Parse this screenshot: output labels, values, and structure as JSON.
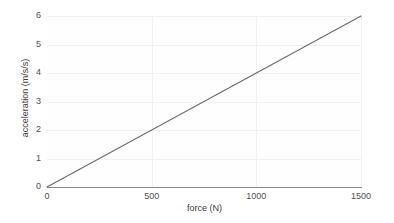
{
  "chart_data": {
    "type": "line",
    "title": "",
    "xlabel": "force (N)",
    "ylabel": "acceleration (m/s/s)",
    "xlim": [
      0,
      1500
    ],
    "ylim": [
      0,
      6
    ],
    "xticks": [
      0,
      500,
      1000,
      1500
    ],
    "xtick_labels": [
      "0",
      "500",
      "1000",
      "1500"
    ],
    "yticks": [
      0,
      1,
      2,
      3,
      4,
      5,
      6
    ],
    "ytick_labels": [
      "0",
      "1",
      "2",
      "3",
      "4",
      "5",
      "6"
    ],
    "grid": true,
    "legend": null,
    "series": [
      {
        "name": "acceleration",
        "color": "#6b6b6b",
        "x": [
          0,
          250,
          500,
          750,
          1000,
          1250,
          1500
        ],
        "values": [
          0,
          1,
          2,
          3,
          4,
          5,
          6
        ]
      }
    ],
    "annotations": []
  },
  "style": {
    "background": "#ffffff",
    "plot_background": "#fefeff",
    "gridline_color": "#f1f1f5",
    "axis_color": "#8a8a8a",
    "tick_text_color": "#4d4d4d",
    "label_text_color": "#3c3c3c",
    "line_color": "#6b6b6b"
  }
}
